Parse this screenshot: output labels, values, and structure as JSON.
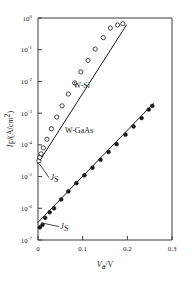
{
  "chart_data": {
    "type": "scatter",
    "title": "",
    "xlabel": "V_a/V",
    "ylabel": "I_F/(A/cm^2)",
    "xlabel_parts": {
      "var": "V",
      "sub": "a",
      "unit": "V"
    },
    "ylabel_parts": {
      "var": "I",
      "sub": "F",
      "unit": "(A/cm",
      "unit_sup": "2",
      "unit_end": ")"
    },
    "xscale": "linear",
    "yscale": "log",
    "xlim": [
      0,
      0.3
    ],
    "ylim": [
      1e-07,
      1
    ],
    "grid": false,
    "legend_position": "inline-annotation",
    "xticks": [
      0,
      0.1,
      0.2,
      0.3
    ],
    "xticklabels": [
      "0",
      "0.1",
      "0.2",
      "0.3"
    ],
    "yticks": [
      1,
      0.1,
      0.01,
      0.001,
      0.0001,
      1e-05,
      1e-06,
      1e-07
    ],
    "yticklabels": [
      {
        "base": "10",
        "exp": "0"
      },
      {
        "base": "10",
        "exp": "-1"
      },
      {
        "base": "10",
        "exp": "-2"
      },
      {
        "base": "10",
        "exp": "-3"
      },
      {
        "base": "10",
        "exp": "-4"
      },
      {
        "base": "10",
        "exp": "-5"
      },
      {
        "base": "10",
        "exp": "-6"
      },
      {
        "base": "10",
        "exp": "-7"
      }
    ],
    "series": [
      {
        "name": "W-Si",
        "label": "W-Si",
        "marker": "open-circle",
        "color": "#1a1a1a",
        "label_x": 0.098,
        "label_y": 0.0062,
        "fit_line": {
          "x": [
            0.0,
            0.198
          ],
          "y": [
            2.6e-05,
            0.6
          ]
        },
        "points": [
          {
            "x": 0.002,
            "y": 3.1e-05
          },
          {
            "x": 0.004,
            "y": 4e-05
          },
          {
            "x": 0.007,
            "y": 5.2e-05
          },
          {
            "x": 0.012,
            "y": 8e-05
          },
          {
            "x": 0.02,
            "y": 0.00015
          },
          {
            "x": 0.03,
            "y": 0.00032
          },
          {
            "x": 0.042,
            "y": 0.00075
          },
          {
            "x": 0.054,
            "y": 0.0017
          },
          {
            "x": 0.068,
            "y": 0.004
          },
          {
            "x": 0.082,
            "y": 0.009
          },
          {
            "x": 0.096,
            "y": 0.02
          },
          {
            "x": 0.112,
            "y": 0.046
          },
          {
            "x": 0.128,
            "y": 0.105
          },
          {
            "x": 0.146,
            "y": 0.24
          },
          {
            "x": 0.162,
            "y": 0.48
          },
          {
            "x": 0.178,
            "y": 0.6
          },
          {
            "x": 0.19,
            "y": 0.66
          }
        ],
        "js_annotation": {
          "label": "J_S",
          "var": "J",
          "sub": "S",
          "point_x": 0.0,
          "point_y": 2.6e-05,
          "text_x": 0.028,
          "text_y": 8e-06
        }
      },
      {
        "name": "W-GaAs",
        "label": "W-GaAs",
        "marker": "filled-circle",
        "color": "#1a1a1a",
        "label_x": 0.092,
        "label_y": 0.00024,
        "fit_line": {
          "x": [
            0.0,
            0.258
          ],
          "y": [
            3.6e-07,
            0.002
          ]
        },
        "points": [
          {
            "x": 0.004,
            "y": 2.5e-07
          },
          {
            "x": 0.01,
            "y": 3e-07
          },
          {
            "x": 0.016,
            "y": 5e-07
          },
          {
            "x": 0.026,
            "y": 7.5e-07
          },
          {
            "x": 0.036,
            "y": 1e-06
          },
          {
            "x": 0.052,
            "y": 1.9e-06
          },
          {
            "x": 0.068,
            "y": 3.4e-06
          },
          {
            "x": 0.086,
            "y": 6.2e-06
          },
          {
            "x": 0.104,
            "y": 1.1e-05
          },
          {
            "x": 0.122,
            "y": 1.9e-05
          },
          {
            "x": 0.14,
            "y": 3.4e-05
          },
          {
            "x": 0.158,
            "y": 6e-05
          },
          {
            "x": 0.176,
            "y": 0.000105
          },
          {
            "x": 0.196,
            "y": 0.00021
          },
          {
            "x": 0.214,
            "y": 0.00038
          },
          {
            "x": 0.232,
            "y": 0.0007
          },
          {
            "x": 0.248,
            "y": 0.0013
          },
          {
            "x": 0.256,
            "y": 0.0017
          }
        ],
        "js_annotation": {
          "label": "J_S",
          "var": "J",
          "sub": "S",
          "point_x": 0.004,
          "point_y": 3.6e-07,
          "text_x": 0.05,
          "text_y": 2.3e-07
        }
      }
    ]
  },
  "axis_colors": {
    "frame": "#3a3a3a",
    "text": "#1a1a1a"
  }
}
